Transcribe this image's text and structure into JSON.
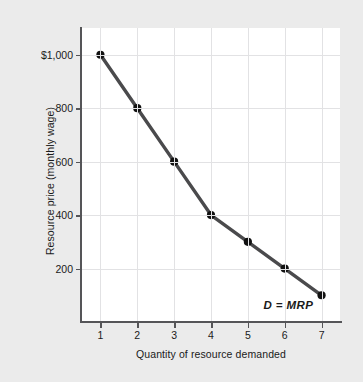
{
  "chart_data": {
    "type": "line",
    "title": "",
    "xlabel": "Quantity of resource demanded",
    "ylabel": "Resource price (monthly wage)",
    "x": [
      1,
      2,
      3,
      4,
      5,
      6,
      7
    ],
    "values": [
      1000,
      800,
      600,
      400,
      300,
      200,
      100
    ],
    "series": [
      {
        "name": "D = MRP",
        "values": [
          1000,
          800,
          600,
          400,
          300,
          200,
          100
        ]
      }
    ],
    "xtick_labels": [
      "1",
      "2",
      "3",
      "4",
      "5",
      "6",
      "7"
    ],
    "ytick_values": [
      1000,
      800,
      600,
      400,
      200
    ],
    "ytick_labels": [
      "$1,000",
      "800",
      "600",
      "400",
      "200"
    ],
    "xlim": [
      0.5,
      7.5
    ],
    "ylim": [
      0,
      1100
    ],
    "grid": true,
    "legend_position": "none",
    "annotations": [
      {
        "text": "D = MRP",
        "x": 7,
        "y": 60
      }
    ],
    "colors": {
      "background": "#ebebeb",
      "plot_background": "#ffffff",
      "line": "#4a4a4c",
      "marker": "#111111",
      "grid": "#e2e2e4",
      "axis": "#555558",
      "text": "#1a1a1a"
    }
  }
}
